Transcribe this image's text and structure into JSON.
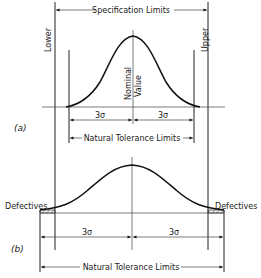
{
  "diagram": {
    "top_label": "Specification Limits",
    "lower_label": "Lower",
    "upper_label": "Upper",
    "nominal_label_1": "Nominal",
    "nominal_label_2": "Value",
    "panel_a": {
      "tag": "(a)",
      "sigma_left": "3σ",
      "sigma_right": "3σ",
      "natural_limits": "Natural Tolerance Limits"
    },
    "panel_b": {
      "tag": "(b)",
      "defectives_left": "Defectives",
      "defectives_right": "Defectives",
      "sigma_left": "3σ",
      "sigma_right": "3σ",
      "natural_limits": "Natural Tolerance Limits"
    }
  }
}
